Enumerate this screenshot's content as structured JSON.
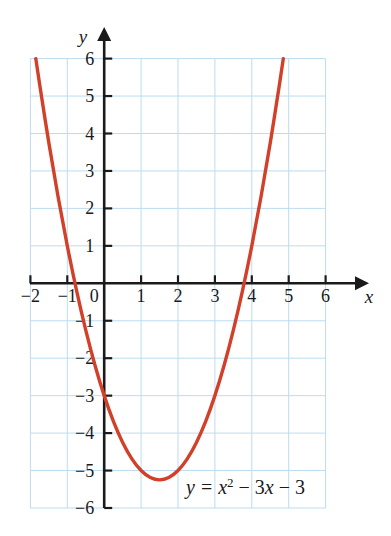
{
  "chart_data": {
    "type": "line",
    "title": "",
    "subtitle": "",
    "xlabel": "x",
    "ylabel": "y",
    "xlim": [
      -2,
      6
    ],
    "ylim": [
      -6,
      6
    ],
    "grid": true,
    "grid_spacing": 1,
    "legend": "none",
    "annotation": "y = x² − 3x − 3",
    "equation": {
      "lhs": "y",
      "eq": "=",
      "term1_base": "x",
      "term1_exp": "2",
      "op1": "−",
      "term2": "3x",
      "op2": "−",
      "term3": "3"
    },
    "function": "y = x^2 - 3x - 3",
    "vertex": [
      1.5,
      -5.25
    ],
    "y_intercept": -3,
    "x_intercepts": [
      -0.791,
      3.791
    ],
    "curve_color": "#d2402a",
    "grid_color": "#bcdcf0",
    "axis_color": "#1a1a1a",
    "x_ticks": [
      -2,
      -1,
      0,
      1,
      2,
      3,
      4,
      5,
      6
    ],
    "x_tick_labels": [
      "−2",
      "−1",
      "0",
      "1",
      "2",
      "3",
      "4",
      "5",
      "6"
    ],
    "y_ticks": [
      6,
      5,
      4,
      3,
      2,
      1,
      -1,
      -2,
      -3,
      -4,
      -5,
      -6
    ],
    "y_tick_labels": [
      "6",
      "5",
      "4",
      "3",
      "2",
      "1",
      "−1",
      "−2",
      "−3",
      "−4",
      "−5",
      "−6"
    ],
    "x": [
      -2,
      -1.75,
      -1.5,
      -1.25,
      -1,
      -0.75,
      -0.5,
      -0.25,
      0,
      0.25,
      0.5,
      0.75,
      1,
      1.25,
      1.5,
      1.75,
      2,
      2.25,
      2.5,
      2.75,
      3,
      3.25,
      3.5,
      3.75,
      4,
      4.25,
      4.5,
      4.75,
      5
    ],
    "values": [
      7,
      5.3125,
      3.75,
      2.3125,
      1,
      -0.1875,
      -1.25,
      -2.1875,
      -3,
      -3.6875,
      -4.25,
      -4.6875,
      -5,
      -5.1875,
      -5.25,
      -5.1875,
      -5,
      -4.6875,
      -4.25,
      -3.6875,
      -3,
      -2.1875,
      -1.25,
      -0.1875,
      1,
      2.3125,
      3.75,
      5.3125,
      7
    ]
  },
  "axis_labels": {
    "x_name": "x",
    "y_name": "y"
  }
}
